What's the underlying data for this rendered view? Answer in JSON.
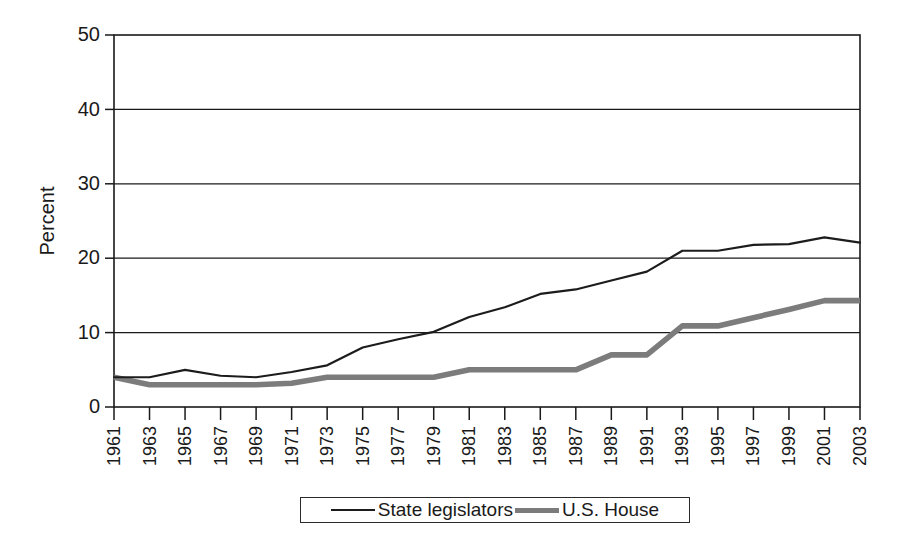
{
  "chart_data": {
    "type": "line",
    "title": "",
    "xlabel": "",
    "ylabel": "Percent",
    "ylim": [
      0,
      50
    ],
    "yticks": [
      0,
      10,
      20,
      30,
      40,
      50
    ],
    "grid": "horizontal",
    "legend_position": "bottom",
    "categories": [
      "1961",
      "1963",
      "1965",
      "1967",
      "1969",
      "1971",
      "1973",
      "1975",
      "1977",
      "1979",
      "1981",
      "1983",
      "1985",
      "1987",
      "1989",
      "1991",
      "1993",
      "1995",
      "1997",
      "1999",
      "2001",
      "2003"
    ],
    "series": [
      {
        "name": "State legislators",
        "color": "#1c1c1c",
        "style": "thin-black-line",
        "values": [
          4.0,
          4.0,
          5.0,
          4.2,
          4.0,
          4.7,
          5.6,
          8.0,
          9.1,
          10.1,
          12.1,
          13.4,
          15.2,
          15.8,
          17.0,
          18.2,
          21.0,
          21.0,
          21.8,
          21.9,
          22.8,
          22.1
        ]
      },
      {
        "name": "U.S. House",
        "color": "#7c7c7c",
        "style": "thick-gray-line",
        "values": [
          4.0,
          3.0,
          3.0,
          3.0,
          3.0,
          3.2,
          4.0,
          4.0,
          4.0,
          4.0,
          5.0,
          5.0,
          5.0,
          5.0,
          7.0,
          7.0,
          10.9,
          10.9,
          12.0,
          13.1,
          14.3,
          14.3
        ]
      }
    ],
    "legend": [
      {
        "label": "State legislators",
        "swatch": "thin-black-line"
      },
      {
        "label": "U.S. House",
        "swatch": "thick-gray-line"
      }
    ]
  },
  "axes": {
    "y_title": "Percent",
    "y_tick_labels": [
      "0",
      "10",
      "20",
      "30",
      "40",
      "50"
    ],
    "x_tick_labels": [
      "1961",
      "1963",
      "1965",
      "1967",
      "1969",
      "1971",
      "1973",
      "1975",
      "1977",
      "1979",
      "1981",
      "1983",
      "1985",
      "1987",
      "1989",
      "1991",
      "1993",
      "1995",
      "1997",
      "1999",
      "2001",
      "2003"
    ]
  },
  "legend": {
    "state_label": "State legislators",
    "house_label": "U.S. House"
  },
  "colors": {
    "state_line": "#1c1c1c",
    "house_line": "#7c7c7c",
    "axis": "#1a1a1a",
    "background": "#ffffff"
  }
}
